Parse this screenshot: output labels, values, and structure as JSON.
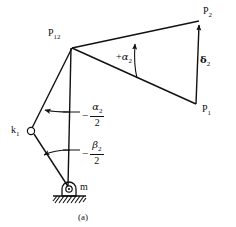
{
  "figure": {
    "caption": "(a)",
    "background_color": "#ffffff",
    "line_color": "#111111"
  },
  "labels": {
    "p12": {
      "base": "P",
      "sub": "12"
    },
    "p1": {
      "base": "P",
      "sub": "1"
    },
    "p2": {
      "base": "P",
      "sub": "2"
    },
    "k1": {
      "base": "k",
      "sub": "1"
    },
    "m": {
      "base": "m"
    },
    "delta2": {
      "base": "δ",
      "sub": "2"
    },
    "alpha2_rotation": {
      "sign": "+",
      "base": "α",
      "sub": "2"
    },
    "alpha2_half": {
      "sign": "−",
      "base": "α",
      "sub": "2",
      "denominator": "2"
    },
    "beta2_half": {
      "sign": "−",
      "base": "β",
      "sub": "2",
      "denominator": "2"
    }
  },
  "geometry": {
    "points": {
      "P12": [
        72,
        48
      ],
      "P2": [
        199,
        21
      ],
      "P1": [
        196,
        104
      ],
      "k1": [
        31,
        131
      ],
      "m": [
        69,
        190
      ]
    },
    "ground_line_y": 196,
    "hatch_count": 9
  }
}
